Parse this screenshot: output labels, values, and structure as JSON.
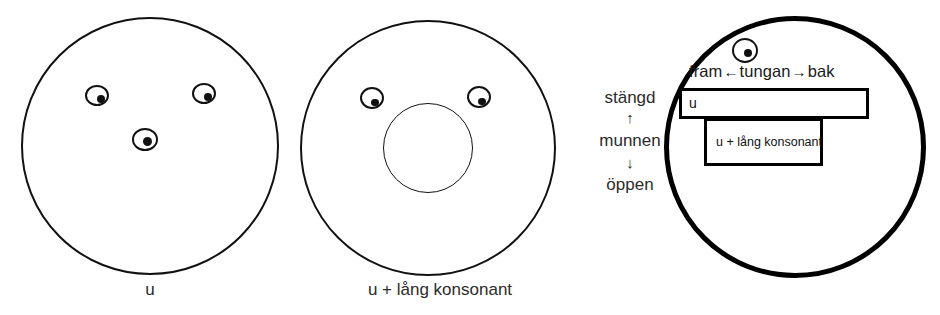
{
  "figure": {
    "width": 940,
    "height": 315,
    "background": "#ffffff",
    "stroke_color": "#111111",
    "text_color": "#2b2b2b"
  },
  "panels": [
    {
      "id": "panel-u",
      "caption": "u",
      "circle": {
        "cx": 150,
        "cy": 146,
        "r": 129,
        "stroke_width": 2.2
      },
      "eyes": [
        {
          "name": "eye-upper-left",
          "cx": 97,
          "cy": 95,
          "rx": 12,
          "ry": 10.5,
          "pupil_dx": 1.5,
          "pupil_dy": 2.0,
          "pupil_r": 4.0
        },
        {
          "name": "eye-upper-right",
          "cx": 204,
          "cy": 93,
          "rx": 12,
          "ry": 10.5,
          "pupil_dx": 1.5,
          "pupil_dy": 2.0,
          "pupil_r": 4.0
        },
        {
          "name": "eye-center",
          "cx": 145,
          "cy": 139,
          "rx": 13,
          "ry": 11.5,
          "pupil_dx": 0,
          "pupil_dy": 0,
          "pupil_r": 4.5
        }
      ],
      "mouth": null
    },
    {
      "id": "panel-u-lang-konsonant",
      "caption": "u + lång konsonant",
      "circle": {
        "cx": 428,
        "cy": 148,
        "r": 128,
        "stroke_width": 2.2
      },
      "eyes": [
        {
          "name": "eye-upper-left",
          "cx": 372,
          "cy": 98,
          "rx": 12,
          "ry": 11,
          "pupil_dx": 1.0,
          "pupil_dy": 2.5,
          "pupil_r": 3.8
        },
        {
          "name": "eye-upper-right",
          "cx": 479,
          "cy": 97,
          "rx": 12,
          "ry": 11,
          "pupil_dx": 1.0,
          "pupil_dy": 2.5,
          "pupil_r": 3.8
        },
        {
          "name": "eye-center",
          "cx": 0,
          "cy": 0,
          "rx": 0,
          "ry": 0,
          "pupil_dx": 0,
          "pupil_dy": 0,
          "pupil_r": 0
        }
      ],
      "mouth": {
        "cx": 428,
        "cy": 148,
        "rx": 45,
        "ry": 45
      }
    },
    {
      "id": "panel-vowel-space",
      "caption": "",
      "circle": {
        "cx": 795,
        "cy": 147,
        "r": 131,
        "stroke_width": 5
      },
      "eyes": [
        {
          "name": "eye-top",
          "cx": 745,
          "cy": 50,
          "rx": 13,
          "ry": 12.5,
          "pupil_dx": 1.0,
          "pupil_dy": 1.0,
          "pupil_r": 4.0
        }
      ],
      "mouth": null
    }
  ],
  "vowel_space": {
    "tongue_axis": {
      "front_label": "fram",
      "left_arrow": "←",
      "center_label": "tungan",
      "right_arrow": "→",
      "back_label": "bak"
    },
    "mouth_axis": {
      "closed_label": "stängd",
      "up_arrow": "↑",
      "center_label": "munnen",
      "down_arrow": "↓",
      "open_label": "öppen"
    },
    "boxes": [
      {
        "id": "box-u",
        "label": "u",
        "x": 679,
        "y": 88,
        "width": 190,
        "height": 31
      },
      {
        "id": "box-ulang",
        "label": "u + lång konsonant",
        "x": 704,
        "y": 118,
        "width": 119,
        "height": 48
      }
    ]
  }
}
